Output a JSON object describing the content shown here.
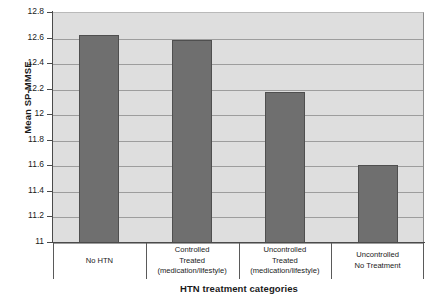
{
  "chart_data": {
    "type": "bar",
    "title": "",
    "xlabel": "HTN treatment categories",
    "ylabel": "Mean SP-MMSE",
    "categories": [
      "No HTN",
      "Controlled Treated (medication/lifestyle)",
      "Uncontrolled Treated (medication/lifestyle)",
      "Uncontrolled No Treatment"
    ],
    "category_lines": [
      [
        "No HTN"
      ],
      [
        "Controlled",
        "Treated",
        "(medication/lifestyle)"
      ],
      [
        "Uncontrolled",
        "Treated",
        "(medication/lifestyle)"
      ],
      [
        "Uncontrolled",
        "No Treatment"
      ]
    ],
    "values": [
      12.63,
      12.59,
      12.18,
      11.61
    ],
    "ylim": [
      11,
      12.8
    ],
    "ytick_labels": [
      "12.8",
      "12.6",
      "12.4",
      "12.2",
      "12",
      "11.8",
      "11.6",
      "11.4",
      "11.2",
      "11"
    ],
    "ytick_values": [
      12.8,
      12.6,
      12.4,
      12.2,
      12.0,
      11.8,
      11.6,
      11.4,
      11.2,
      11.0
    ],
    "grid": true,
    "legend": "none",
    "colors": {
      "bar_fill": "#6f6f6f",
      "bar_border": "#4f4f4f",
      "plot_background": "#dedede",
      "gridline": "#9d9d9d",
      "axis": "#4a4a4a",
      "text": "#1a1a1a",
      "page_background": "#ffffff"
    }
  }
}
